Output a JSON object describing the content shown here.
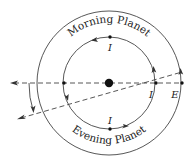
{
  "diagram": {
    "colors": {
      "line": "#333333",
      "background": "#ffffff"
    },
    "geometry": {
      "center": [
        109,
        83
      ],
      "inner_radius": 46,
      "outer_radius": 72
    },
    "labels": {
      "morning": "Morning Planet",
      "evening": "Evening Planet",
      "inferior_top": "I",
      "inferior_right": "I",
      "inferior_bottom": "I",
      "earth": "E"
    },
    "nodes": [
      {
        "name": "sun",
        "x": 109,
        "y": 83
      },
      {
        "name": "planet-top",
        "x": 109,
        "y": 37
      },
      {
        "name": "planet-bottom",
        "x": 109,
        "y": 129
      },
      {
        "name": "planet-left",
        "x": 63,
        "y": 83
      },
      {
        "name": "planet-right",
        "x": 155,
        "y": 83
      },
      {
        "name": "earth",
        "x": 181,
        "y": 83
      }
    ],
    "orbit_direction": "counterclockwise"
  }
}
